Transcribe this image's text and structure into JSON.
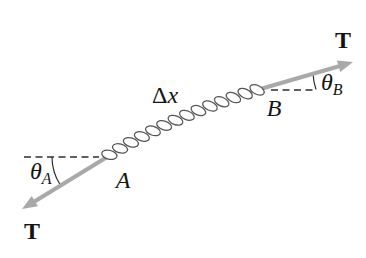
{
  "diagram": {
    "labels": {
      "tension_top": "T",
      "tension_bottom": "T",
      "segment_delta": "Δ",
      "segment_var": "x",
      "point_a": "A",
      "point_b": "B",
      "angle_a_symbol": "θ",
      "angle_a_sub": "A",
      "angle_b_symbol": "θ",
      "angle_b_sub": "B"
    },
    "colors": {
      "background": "#ffffff",
      "arrow": "#a9a9a9",
      "rope_outline": "#545454",
      "rope_fill": "#ffffff",
      "line": "#2e2e2e",
      "text": "#141414"
    }
  }
}
